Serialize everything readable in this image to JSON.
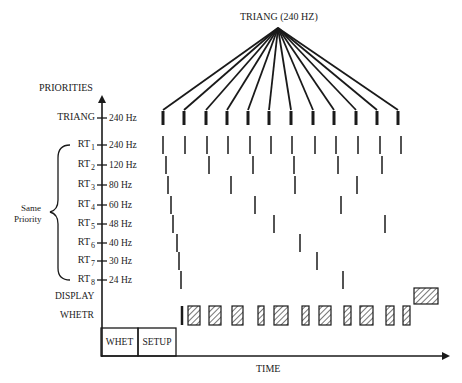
{
  "diagram": {
    "title": "TRIANG (240 HZ)",
    "y_axis_label": "PRIORITIES",
    "x_axis_label": "TIME",
    "group_brace_label_line1": "Same",
    "group_brace_label_line2": "Priority",
    "rows": [
      {
        "id": "triang",
        "name": "TRIANG",
        "sub": "",
        "freq": "240 Hz",
        "y": 118,
        "ticks": [
          163,
          184,
          206,
          227,
          248,
          269,
          291,
          313,
          334,
          356,
          377,
          398
        ],
        "tick_height": 14,
        "tick_width": 3
      },
      {
        "id": "rt1",
        "name": "RT",
        "sub": "1",
        "freq": "240 Hz",
        "y": 145,
        "ticks": [
          163,
          185,
          207,
          228,
          250,
          271,
          292,
          315,
          336,
          358,
          380,
          401
        ],
        "tick_height": 18,
        "tick_width": 1.5
      },
      {
        "id": "rt2",
        "name": "RT",
        "sub": "2",
        "freq": "120 Hz",
        "y": 165,
        "ticks": [
          166,
          209,
          253,
          294,
          338,
          382
        ],
        "tick_height": 18,
        "tick_width": 1.5
      },
      {
        "id": "rt3",
        "name": "RT",
        "sub": "3",
        "freq": "80 Hz",
        "y": 185,
        "ticks": [
          168,
          231,
          295,
          357
        ],
        "tick_height": 18,
        "tick_width": 1.5
      },
      {
        "id": "rt4",
        "name": "RT",
        "sub": "4",
        "freq": "60 Hz",
        "y": 205,
        "ticks": [
          171,
          255,
          341
        ],
        "tick_height": 18,
        "tick_width": 1.5
      },
      {
        "id": "rt5",
        "name": "RT",
        "sub": "5",
        "freq": "48 Hz",
        "y": 224,
        "ticks": [
          173,
          274,
          385
        ],
        "tick_height": 18,
        "tick_width": 1.5
      },
      {
        "id": "rt6",
        "name": "RT",
        "sub": "6",
        "freq": "40 Hz",
        "y": 243,
        "ticks": [
          177,
          300
        ],
        "tick_height": 18,
        "tick_width": 1.5
      },
      {
        "id": "rt7",
        "name": "RT",
        "sub": "7",
        "freq": "30 Hz",
        "y": 261,
        "ticks": [
          179,
          317
        ],
        "tick_height": 18,
        "tick_width": 1.5
      },
      {
        "id": "rt8",
        "name": "RT",
        "sub": "8",
        "freq": "24 Hz",
        "y": 280,
        "ticks": [
          181,
          343
        ],
        "tick_height": 18,
        "tick_width": 1.5
      }
    ],
    "display_row": {
      "name": "DISPLAY",
      "y": 296,
      "block": {
        "x1": 414,
        "x2": 438,
        "y1": 288,
        "y2": 304
      }
    },
    "whetr_row": {
      "name": "WHETR",
      "y": 315,
      "y1": 306,
      "y2": 325,
      "solid_bar_x": 182,
      "blocks": [
        [
          188,
          200
        ],
        [
          209,
          221
        ],
        [
          232,
          243
        ],
        [
          258,
          264
        ],
        [
          274,
          288
        ],
        [
          302,
          309
        ],
        [
          319,
          331
        ],
        [
          344,
          351
        ],
        [
          360,
          373
        ],
        [
          386,
          394
        ],
        [
          403,
          410
        ]
      ]
    },
    "bottom_boxes": [
      {
        "label": "WHET",
        "x1": 101,
        "x2": 138
      },
      {
        "label": "SETUP",
        "x1": 138,
        "x2": 176
      }
    ],
    "fan_apex": {
      "x": 278,
      "y": 28
    },
    "colors": {
      "ink": "#1a1a1a",
      "background": "#ffffff"
    }
  }
}
